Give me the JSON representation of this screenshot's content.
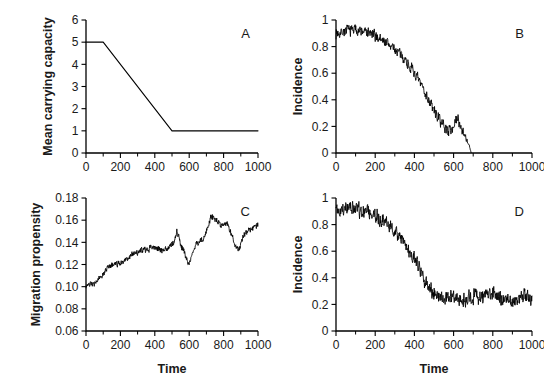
{
  "figure": {
    "background": "#ffffff",
    "line_color": "#000000",
    "panels": [
      "A",
      "B",
      "C",
      "D"
    ]
  },
  "chart_data": [
    {
      "panel": "A",
      "label": "A",
      "type": "line",
      "title": "",
      "xlabel": "",
      "ylabel": "Mean carrying capacity",
      "xlim": [
        0,
        1000
      ],
      "ylim": [
        0,
        6
      ],
      "xticks": [
        0,
        200,
        400,
        600,
        800,
        1000
      ],
      "xticklabels": [
        "0",
        "200",
        "400",
        "600",
        "800",
        "1000"
      ],
      "yticks": [
        0,
        1,
        2,
        3,
        4,
        5,
        6
      ],
      "yticklabels": [
        "0",
        "1",
        "2",
        "3",
        "4",
        "5",
        "6"
      ],
      "xminor": [
        100,
        300,
        500,
        700,
        900
      ],
      "grid": false,
      "legend": false,
      "x": [
        0,
        100,
        500,
        1000
      ],
      "values": [
        5,
        5,
        1,
        1
      ],
      "description": "Flat at 5 until t=100, linear decline to 1 at t=500, flat at 1 to t=1000"
    },
    {
      "panel": "B",
      "label": "B",
      "type": "line",
      "title": "",
      "xlabel": "",
      "ylabel": "Incidence",
      "xlim": [
        0,
        1000
      ],
      "ylim": [
        0,
        1
      ],
      "xticks": [
        0,
        200,
        400,
        600,
        800,
        1000
      ],
      "xticklabels": [
        "0",
        "200",
        "400",
        "600",
        "800",
        "1000"
      ],
      "yticks": [
        0,
        0.2,
        0.4,
        0.6,
        0.8,
        1
      ],
      "yticklabels": [
        "0",
        "0.2",
        "0.4",
        "0.6",
        "0.8",
        "1"
      ],
      "xminor": [
        100,
        300,
        500,
        700,
        900
      ],
      "grid": false,
      "legend": false,
      "noise_amplitude": 0.035,
      "noise_seed": 7,
      "x": [
        0,
        50,
        100,
        150,
        200,
        250,
        300,
        350,
        400,
        450,
        500,
        550,
        575,
        600,
        620,
        640,
        660,
        680,
        690
      ],
      "values": [
        0.9,
        0.92,
        0.93,
        0.91,
        0.88,
        0.84,
        0.78,
        0.71,
        0.6,
        0.47,
        0.32,
        0.2,
        0.17,
        0.2,
        0.26,
        0.19,
        0.13,
        0.05,
        0.0
      ],
      "description": "Noisy incidence declining from ~0.92 to extinction (0) at t~690; curve ends there"
    },
    {
      "panel": "C",
      "label": "C",
      "type": "line",
      "title": "",
      "xlabel": "Time",
      "ylabel": "Migration propensity",
      "xlim": [
        0,
        1000
      ],
      "ylim": [
        0.06,
        0.18
      ],
      "xticks": [
        0,
        200,
        400,
        600,
        800,
        1000
      ],
      "xticklabels": [
        "0",
        "200",
        "400",
        "600",
        "800",
        "1000"
      ],
      "yticks": [
        0.06,
        0.08,
        0.1,
        0.12,
        0.14,
        0.16,
        0.18
      ],
      "yticklabels": [
        "0.06",
        "0.08",
        "0.10",
        "0.12",
        "0.14",
        "0.16",
        "0.18"
      ],
      "xminor": [
        100,
        300,
        500,
        700,
        900
      ],
      "grid": false,
      "legend": false,
      "noise_amplitude": 0.0022,
      "noise_seed": 23,
      "x": [
        0,
        40,
        70,
        100,
        130,
        160,
        200,
        240,
        280,
        320,
        360,
        400,
        440,
        470,
        510,
        530,
        555,
        580,
        600,
        620,
        650,
        680,
        710,
        730,
        760,
        790,
        820,
        850,
        870,
        890,
        920,
        950,
        980,
        1000
      ],
      "values": [
        0.101,
        0.102,
        0.106,
        0.112,
        0.118,
        0.12,
        0.121,
        0.126,
        0.13,
        0.132,
        0.134,
        0.136,
        0.133,
        0.134,
        0.14,
        0.15,
        0.136,
        0.127,
        0.12,
        0.132,
        0.139,
        0.142,
        0.155,
        0.164,
        0.16,
        0.154,
        0.157,
        0.146,
        0.136,
        0.134,
        0.147,
        0.151,
        0.155,
        0.156
      ],
      "description": "Noisy upward random-walk from 0.10 to ~0.156 with dips near t=590 and t=870"
    },
    {
      "panel": "D",
      "label": "D",
      "type": "line",
      "title": "",
      "xlabel": "Time",
      "ylabel": "Incidence",
      "xlim": [
        0,
        1000
      ],
      "ylim": [
        0,
        1
      ],
      "xticks": [
        0,
        200,
        400,
        600,
        800,
        1000
      ],
      "xticklabels": [
        "0",
        "200",
        "400",
        "600",
        "800",
        "1000"
      ],
      "yticks": [
        0,
        0.2,
        0.4,
        0.6,
        0.8,
        1
      ],
      "yticklabels": [
        "0",
        "0.2",
        "0.4",
        "0.6",
        "0.8",
        "1"
      ],
      "xminor": [
        100,
        300,
        500,
        700,
        900
      ],
      "grid": false,
      "legend": false,
      "noise_amplitude": 0.045,
      "noise_seed": 41,
      "x": [
        0,
        50,
        100,
        150,
        200,
        250,
        300,
        350,
        400,
        450,
        500,
        550,
        600,
        650,
        700,
        750,
        800,
        850,
        900,
        950,
        1000
      ],
      "values": [
        0.9,
        0.92,
        0.92,
        0.9,
        0.87,
        0.82,
        0.74,
        0.65,
        0.54,
        0.39,
        0.28,
        0.24,
        0.25,
        0.22,
        0.27,
        0.25,
        0.28,
        0.24,
        0.22,
        0.26,
        0.24
      ],
      "description": "Noisy incidence declining from ~0.92 to a persistent plateau around 0.25 after t~500"
    }
  ]
}
